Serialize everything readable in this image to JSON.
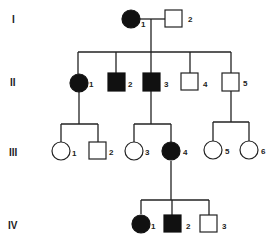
{
  "diagram": {
    "type": "pedigree",
    "generations": [
      {
        "label": "I",
        "y": 19
      },
      {
        "label": "II",
        "y": 82
      },
      {
        "label": "III",
        "y": 151
      },
      {
        "label": "IV",
        "y": 224
      }
    ],
    "individuals": [
      {
        "id": "I-1",
        "number": "1",
        "sex": "female",
        "affected": true
      },
      {
        "id": "I-2",
        "number": "2",
        "sex": "male",
        "affected": false
      },
      {
        "id": "II-1",
        "number": "1",
        "sex": "female",
        "affected": true
      },
      {
        "id": "II-2",
        "number": "2",
        "sex": "male",
        "affected": true
      },
      {
        "id": "II-3",
        "number": "3",
        "sex": "male",
        "affected": true
      },
      {
        "id": "II-4",
        "number": "4",
        "sex": "male",
        "affected": false
      },
      {
        "id": "II-5",
        "number": "5",
        "sex": "male",
        "affected": false
      },
      {
        "id": "III-1",
        "number": "1",
        "sex": "female",
        "affected": false
      },
      {
        "id": "III-2",
        "number": "2",
        "sex": "male",
        "affected": false
      },
      {
        "id": "III-3",
        "number": "3",
        "sex": "female",
        "affected": false
      },
      {
        "id": "III-4",
        "number": "4",
        "sex": "female",
        "affected": true
      },
      {
        "id": "III-5",
        "number": "5",
        "sex": "female",
        "affected": false
      },
      {
        "id": "III-6",
        "number": "6",
        "sex": "female",
        "affected": false
      },
      {
        "id": "IV-1",
        "number": "1",
        "sex": "female",
        "affected": true
      },
      {
        "id": "IV-2",
        "number": "2",
        "sex": "male",
        "affected": true
      },
      {
        "id": "IV-3",
        "number": "3",
        "sex": "male",
        "affected": false
      }
    ],
    "relationships": [
      {
        "parents": [
          "I-1",
          "I-2"
        ],
        "children": [
          "II-1",
          "II-2",
          "II-3",
          "II-4",
          "II-5"
        ]
      },
      {
        "parents": [
          "II-1"
        ],
        "children": [
          "III-1",
          "III-2"
        ]
      },
      {
        "parents": [
          "II-3"
        ],
        "children": [
          "III-3",
          "III-4"
        ]
      },
      {
        "parents": [
          "II-5"
        ],
        "children": [
          "III-5",
          "III-6"
        ]
      },
      {
        "parents": [
          "III-4"
        ],
        "children": [
          "IV-1",
          "IV-2",
          "IV-3"
        ]
      }
    ],
    "colors": {
      "affected": "#111111",
      "unaffected": "#ffffff",
      "line": "#222222"
    }
  }
}
